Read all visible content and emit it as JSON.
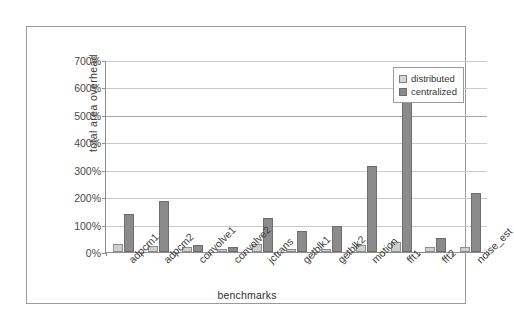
{
  "chart_data": {
    "type": "bar",
    "title": "",
    "xlabel": "benchmarks",
    "ylabel": "total area overhead",
    "ylim": [
      0,
      700
    ],
    "ytick_labels": [
      "0%",
      "100%",
      "200%",
      "300%",
      "400%",
      "500%",
      "600%",
      "700%"
    ],
    "ytick_values": [
      0,
      100,
      200,
      300,
      400,
      500,
      600,
      700
    ],
    "grid": true,
    "legend_position": "upper-right-inside",
    "categories": [
      "adpcm1",
      "adpcm2",
      "convolve1",
      "convolve2",
      "jctrans",
      "getblk1",
      "getblk2",
      "motion",
      "fft1",
      "fft2",
      "noise_est"
    ],
    "series": [
      {
        "name": "distributed",
        "color": "#cfcfcf",
        "values": [
          30,
          22,
          20,
          12,
          28,
          10,
          12,
          25,
          35,
          18,
          20
        ]
      },
      {
        "name": "centralized",
        "color": "#8b8b8b",
        "values": [
          140,
          185,
          25,
          20,
          125,
          78,
          95,
          315,
          635,
          50,
          215
        ]
      }
    ]
  },
  "legend": {
    "items": [
      {
        "label": "distributed",
        "swatch": "distributed"
      },
      {
        "label": "centralized",
        "swatch": "centralized"
      }
    ]
  }
}
